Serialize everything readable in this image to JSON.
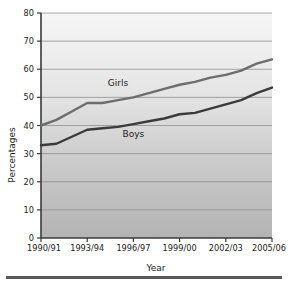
{
  "chart_data": {
    "type": "line",
    "title": "",
    "xlabel": "Year",
    "ylabel": "Percentages",
    "ylim": [
      0,
      80
    ],
    "ytick_step": 10,
    "grid": true,
    "legend": "inline-labels",
    "x": [
      "1990/91",
      "1991/92",
      "1992/93",
      "1993/94",
      "1994/95",
      "1995/96",
      "1996/97",
      "1997/98",
      "1998/99",
      "1999/00",
      "2000/01",
      "2001/02",
      "2002/03",
      "2003/04",
      "2004/05",
      "2005/06"
    ],
    "xtick_labels": [
      "1990/91",
      "1993/94",
      "1996/97",
      "1999/00",
      "2002/03",
      "2005/06"
    ],
    "ytick_labels": [
      "0",
      "10",
      "20",
      "30",
      "40",
      "50",
      "60",
      "70",
      "80"
    ],
    "series": [
      {
        "name": "Girls",
        "color": "#6d6d6d",
        "values": [
          40.0,
          42.0,
          45.0,
          48.0,
          48.0,
          49.0,
          50.0,
          51.5,
          53.0,
          54.5,
          55.5,
          57.0,
          58.0,
          59.5,
          62.0,
          63.5
        ]
      },
      {
        "name": "Boys",
        "color": "#3b3b3b",
        "values": [
          33.0,
          33.5,
          36.0,
          38.5,
          39.0,
          39.5,
          40.5,
          41.5,
          42.5,
          44.0,
          44.5,
          46.0,
          47.5,
          49.0,
          51.5,
          53.5
        ]
      }
    ],
    "annotations": [
      {
        "text": "Girls",
        "x": "1995/96",
        "y": 54.0
      },
      {
        "text": "Boys",
        "x": "1996/97",
        "y": 36.0
      }
    ]
  },
  "colors": {
    "plot_bg_top": "#f2f2f2",
    "plot_bg_bottom": "#b5b5b5",
    "grid": "#8f8f8f",
    "axis": "#3a3a3a",
    "rule": "#58585a",
    "text": "#1a1a1a"
  },
  "axis_labels": {
    "y_title": "Percentages",
    "x_title": "Year"
  }
}
